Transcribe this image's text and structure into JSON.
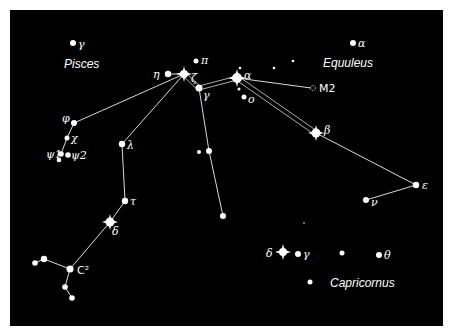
{
  "constellations": [
    {
      "name": "Pisces",
      "x": 64,
      "y": 68
    },
    {
      "name": "Equuleus",
      "x": 323,
      "y": 67
    },
    {
      "name": "Capricornus",
      "x": 330,
      "y": 287
    }
  ],
  "labels": {
    "pisces_gamma": "γ",
    "equuleus_alpha": "α",
    "eta": "η",
    "pi": "π",
    "zeta": "ζ",
    "gamma_aqr": "γ",
    "alpha_aqr": "α",
    "omicron": "o",
    "m2": "M2",
    "beta": "β",
    "phi": "φ",
    "chi": "χ",
    "psi1": "ψ1",
    "psi2": "ψ2",
    "lambda": "λ",
    "tau": "τ",
    "delta_aqr": "δ",
    "c2": "C²",
    "epsilon": "ε",
    "nu": "ν",
    "delta_cap": "δ",
    "gamma_cap": "γ",
    "theta_cap": "θ"
  },
  "colors": {
    "sky": "#000000",
    "stars": "#ffffff",
    "lines": "#d8d8d8",
    "border": "#ffffff"
  }
}
